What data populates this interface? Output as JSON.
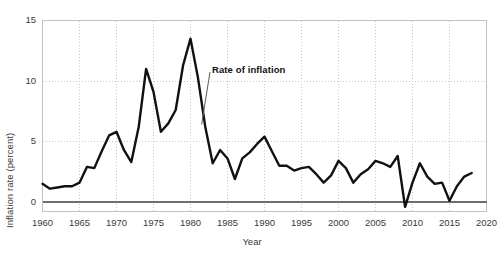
{
  "chart_data": {
    "type": "line",
    "title": "",
    "xlabel": "Year",
    "ylabel": "Inflation rate (percent)",
    "xlim": [
      1960,
      2020
    ],
    "ylim": [
      0,
      15
    ],
    "xticks": [
      1960,
      1965,
      1970,
      1975,
      1980,
      1985,
      1990,
      1995,
      2000,
      2005,
      2010,
      2015,
      2020
    ],
    "yticks": [
      0,
      5,
      10,
      15
    ],
    "grid": "dotted-both",
    "legend": "none",
    "annotations": [
      {
        "text": "Rate of inflation",
        "x": 1983,
        "y": 9.0,
        "points_to_x": 1981.5,
        "points_to_y": 6.4
      }
    ],
    "series": [
      {
        "name": "Rate of inflation",
        "color": "#111111",
        "x": [
          1960,
          1961,
          1962,
          1963,
          1964,
          1965,
          1966,
          1967,
          1968,
          1969,
          1970,
          1971,
          1972,
          1973,
          1974,
          1975,
          1976,
          1977,
          1978,
          1979,
          1980,
          1981,
          1982,
          1983,
          1984,
          1985,
          1986,
          1987,
          1988,
          1989,
          1990,
          1991,
          1992,
          1993,
          1994,
          1995,
          1996,
          1997,
          1998,
          1999,
          2000,
          2001,
          2002,
          2003,
          2004,
          2005,
          2006,
          2007,
          2008,
          2009,
          2010,
          2011,
          2012,
          2013,
          2014,
          2015,
          2016,
          2017,
          2018
        ],
        "values": [
          1.5,
          1.1,
          1.2,
          1.3,
          1.3,
          1.6,
          2.9,
          2.8,
          4.2,
          5.5,
          5.8,
          4.3,
          3.3,
          6.2,
          11.0,
          9.1,
          5.8,
          6.5,
          7.6,
          11.3,
          13.5,
          10.3,
          6.2,
          3.2,
          4.3,
          3.6,
          1.9,
          3.6,
          4.1,
          4.8,
          5.4,
          4.2,
          3.0,
          3.0,
          2.6,
          2.8,
          2.9,
          2.3,
          1.6,
          2.2,
          3.4,
          2.8,
          1.6,
          2.3,
          2.7,
          3.4,
          3.2,
          2.9,
          3.8,
          -0.4,
          1.6,
          3.2,
          2.1,
          1.5,
          1.6,
          0.1,
          1.3,
          2.1,
          2.4
        ]
      }
    ]
  },
  "axes": {
    "y_title": "Inflation rate (percent)",
    "x_title": "Year",
    "y_tick_labels": [
      "15",
      "10",
      "5",
      "0"
    ],
    "x_tick_labels": [
      "1960",
      "1965",
      "1970",
      "1975",
      "1980",
      "1985",
      "1990",
      "1995",
      "2000",
      "2005",
      "2010",
      "2015",
      "2020"
    ]
  },
  "annotation": {
    "label": "Rate of inflation"
  },
  "style": {
    "line_color": "#111111",
    "grid_color": "#c9c9c9",
    "frame_color": "#bfc1c3",
    "zero_line_color": "#6d6e71",
    "text_color": "#3a3a3a"
  }
}
